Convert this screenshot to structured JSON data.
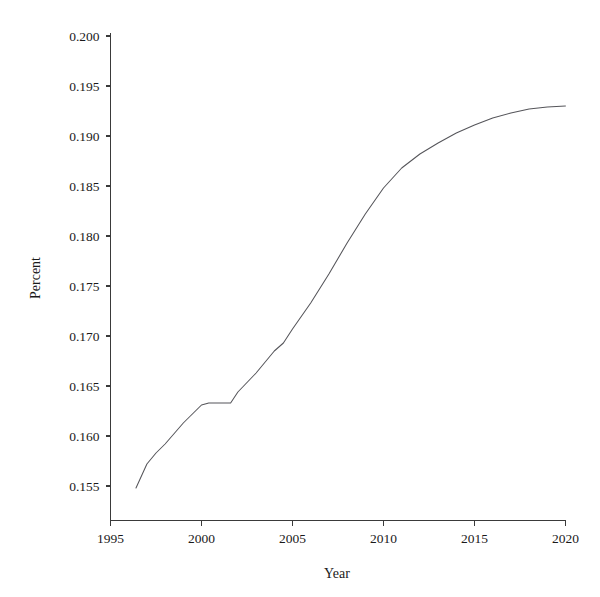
{
  "chart_data": {
    "type": "line",
    "title": "",
    "xlabel": "Year",
    "ylabel": "Percent",
    "xlim": [
      1995,
      2020
    ],
    "ylim": [
      0.1525,
      0.2005
    ],
    "grid": false,
    "legend": "none",
    "x_ticks": [
      "1995",
      "2000",
      "2005",
      "2010",
      "2015",
      "2020"
    ],
    "x_tick_values": [
      1995,
      2000,
      2005,
      2010,
      2015,
      2020
    ],
    "y_ticks": [
      "0.155",
      "0.160",
      "0.165",
      "0.170",
      "0.175",
      "0.180",
      "0.185",
      "0.190",
      "0.195",
      "0.200"
    ],
    "y_tick_values": [
      0.155,
      0.16,
      0.165,
      0.17,
      0.175,
      0.18,
      0.185,
      0.19,
      0.195,
      0.2
    ],
    "series": [
      {
        "name": "Percent",
        "color": "#55555a",
        "x": [
          1996.4,
          1997.0,
          1997.5,
          1998.0,
          1999.0,
          2000.0,
          2000.4,
          2001.6,
          2002.0,
          2003.0,
          2004.0,
          2004.5,
          2005.0,
          2006.0,
          2007.0,
          2008.0,
          2009.0,
          2010.0,
          2011.0,
          2012.0,
          2013.0,
          2014.0,
          2015.0,
          2016.0,
          2017.0,
          2018.0,
          2019.0,
          2020.0
        ],
        "y": [
          0.1548,
          0.1572,
          0.1583,
          0.1592,
          0.1613,
          0.1631,
          0.1633,
          0.1633,
          0.1644,
          0.1663,
          0.1685,
          0.1693,
          0.1707,
          0.1733,
          0.1762,
          0.1793,
          0.1822,
          0.1848,
          0.1868,
          0.1882,
          0.1893,
          0.1903,
          0.1911,
          0.1918,
          0.1923,
          0.1927,
          0.1929,
          0.193
        ]
      }
    ]
  },
  "axes": {
    "x_title": "Year",
    "y_title": "Percent"
  }
}
